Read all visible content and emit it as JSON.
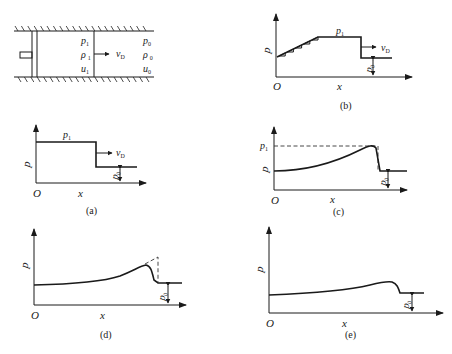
{
  "tube": {
    "left_state": {
      "p": "p",
      "p_sub": "1",
      "rho": "ρ",
      "rho_sub": "1",
      "u": "u",
      "u_sub": "1"
    },
    "right_state": {
      "p": "p",
      "p_sub": "0",
      "rho": "ρ",
      "rho_sub": "0",
      "u": "u",
      "u_sub": "0"
    },
    "velocity": {
      "v": "v",
      "v_sub": "D"
    }
  },
  "panels": {
    "a": {
      "caption": "(a)",
      "ylabel": "p",
      "xlabel": "x",
      "origin": "O",
      "p1": "p",
      "p1_sub": "1",
      "p0": "p",
      "p0_sub": "0",
      "v": "v",
      "v_sub": "D"
    },
    "b": {
      "caption": "(b)",
      "ylabel": "p",
      "xlabel": "x",
      "origin": "O",
      "p1": "p",
      "p1_sub": "1",
      "p0": "p",
      "p0_sub": "0",
      "v": "v",
      "v_sub": "D"
    },
    "c": {
      "caption": "(c)",
      "ylabel": "p",
      "xlabel": "x",
      "origin": "O",
      "p1": "p",
      "p1_sub": "1",
      "p0": "p",
      "p0_sub": "0"
    },
    "d": {
      "caption": "(d)",
      "ylabel": "p",
      "xlabel": "x",
      "origin": "O",
      "p0": "p",
      "p0_sub": "0"
    },
    "e": {
      "caption": "(e)",
      "ylabel": "p",
      "xlabel": "x",
      "origin": "O",
      "p0": "p",
      "p0_sub": "0"
    }
  }
}
